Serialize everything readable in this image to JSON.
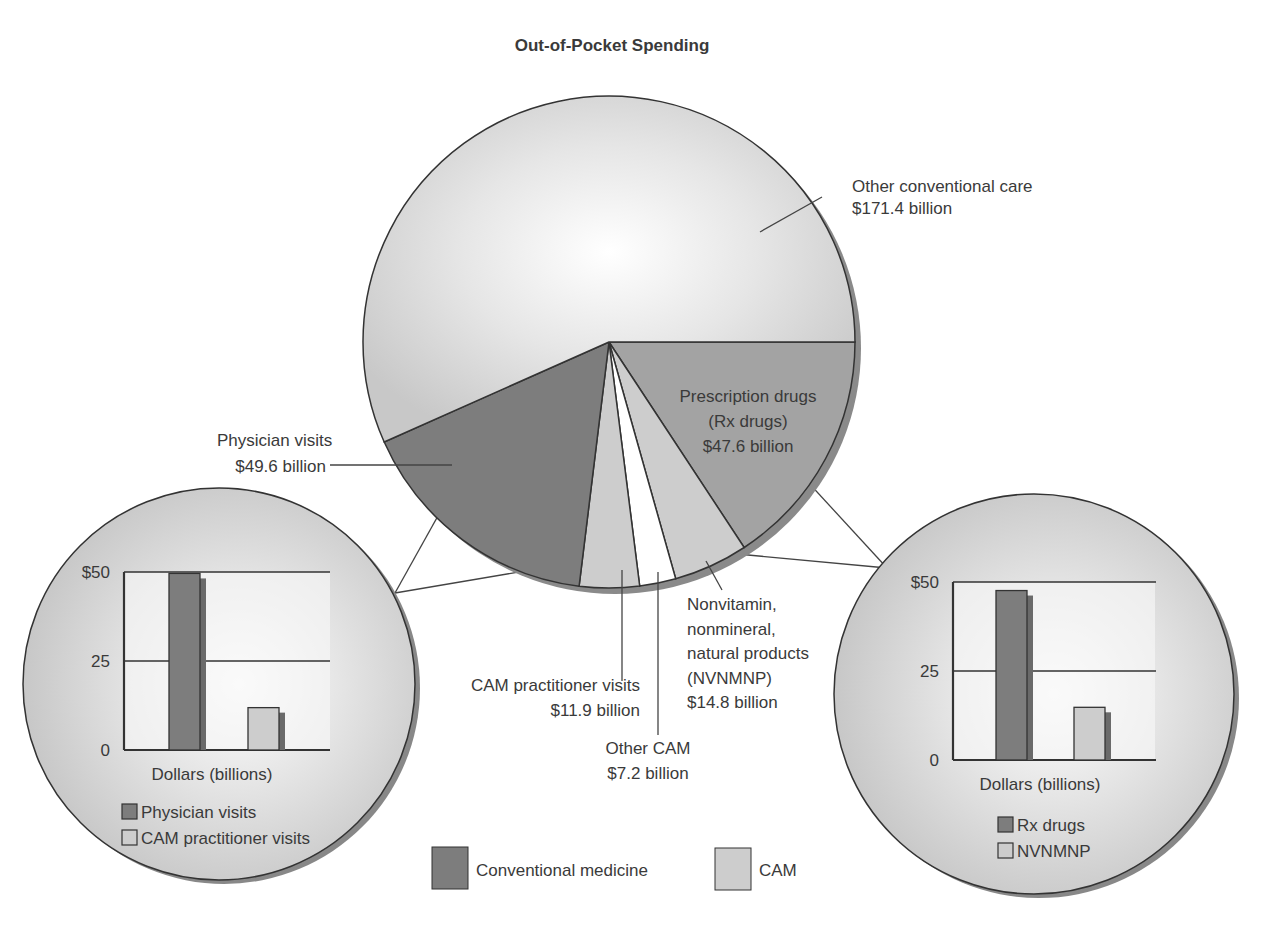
{
  "title": "Out-of-Pocket Spending",
  "colors": {
    "conventional": "#7d7d7d",
    "rx": "#a3a3a3",
    "cam": "#cdcdcd",
    "other_conventional": "#d9d9d9",
    "other_cam": "#ffffff",
    "shadow": "#8a8a8a",
    "outline": "#333333"
  },
  "legend": {
    "items": [
      {
        "label": "Conventional medicine",
        "color": "#7d7d7d"
      },
      {
        "label": "CAM",
        "color": "#cdcdcd"
      }
    ]
  },
  "chart_data": [
    {
      "type": "pie",
      "title": "Out-of-Pocket Spending",
      "units": "billion USD",
      "start_angle_deg": 0,
      "direction": "clockwise",
      "slices": [
        {
          "key": "rx",
          "label": "Prescription drugs (Rx drugs)",
          "value": 47.6,
          "value_label": "$47.6 billion",
          "group": "Conventional medicine"
        },
        {
          "key": "nvnmnp",
          "label": "Nonvitamin, nonmineral, natural products (NVNMNP)",
          "value": 14.8,
          "value_label": "$14.8 billion",
          "group": "CAM"
        },
        {
          "key": "other_cam",
          "label": "Other CAM",
          "value": 7.2,
          "value_label": "$7.2 billion",
          "group": "CAM"
        },
        {
          "key": "cam_visits",
          "label": "CAM practitioner visits",
          "value": 11.9,
          "value_label": "$11.9 billion",
          "group": "CAM"
        },
        {
          "key": "physician",
          "label": "Physician visits",
          "value": 49.6,
          "value_label": "$49.6 billion",
          "group": "Conventional medicine"
        },
        {
          "key": "other_conv",
          "label": "Other conventional care",
          "value": 171.4,
          "value_label": "$171.4 billion",
          "group": "Conventional medicine"
        }
      ],
      "annotations": {
        "other_conv": [
          "Other conventional care",
          "$171.4 billion"
        ],
        "rx": [
          "Prescription drugs",
          "(Rx drugs)",
          "$47.6 billion"
        ],
        "physician": [
          "Physician visits",
          "$49.6 billion"
        ],
        "cam_visits": [
          "CAM practitioner visits",
          "$11.9 billion"
        ],
        "other_cam": [
          "Other CAM",
          "$7.2 billion"
        ],
        "nvnmnp": [
          "Nonvitamin,",
          "nonmineral,",
          "natural products",
          "(NVNMNP)",
          "$14.8 billion"
        ]
      }
    },
    {
      "type": "bar",
      "title": "",
      "xlabel": "Dollars (billions)",
      "ylabel": "",
      "ylim": [
        0,
        50
      ],
      "yticks": [
        "0",
        "25",
        "$50"
      ],
      "grid": true,
      "categories": [
        "Physician visits",
        "CAM practitioner visits"
      ],
      "values": [
        49.6,
        11.9
      ],
      "legend": [
        "Physician visits",
        "CAM practitioner visits"
      ]
    },
    {
      "type": "bar",
      "title": "",
      "xlabel": "Dollars (billions)",
      "ylabel": "",
      "ylim": [
        0,
        50
      ],
      "yticks": [
        "0",
        "25",
        "$50"
      ],
      "grid": true,
      "categories": [
        "Rx drugs",
        "NVNMNP"
      ],
      "values": [
        47.6,
        14.8
      ],
      "legend": [
        "Rx drugs",
        "NVNMNP"
      ]
    }
  ]
}
